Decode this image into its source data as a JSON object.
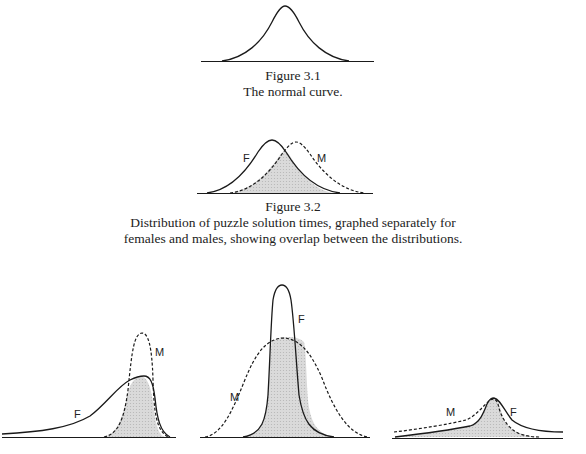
{
  "figure_3_1": {
    "number": "Figure 3.1",
    "caption": "The normal curve."
  },
  "figure_3_2": {
    "number": "Figure 3.2",
    "caption_line1": "Distribution of puzzle solution times, graphed separately for",
    "caption_line2": "females and males, showing overlap between the distributions.",
    "labels": {
      "female": "F",
      "male": "M"
    }
  },
  "figure_3_3": {
    "panels": [
      {
        "labels": {
          "female": "F",
          "male": "M"
        }
      },
      {
        "labels": {
          "female": "F",
          "male": "M"
        }
      },
      {
        "labels": {
          "female": "F",
          "male": "M"
        }
      }
    ]
  },
  "colors": {
    "line": "#1a1a1a",
    "overlap_fill": "#d4d4d4"
  }
}
